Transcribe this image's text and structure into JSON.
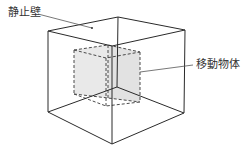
{
  "labels": {
    "static_wall": "静止壁",
    "moving_object": "移動物体"
  },
  "colors": {
    "line": "#2a2a2a",
    "dashed": "#4a4a4a",
    "fill": "#e8e8e8",
    "text": "#333333"
  }
}
